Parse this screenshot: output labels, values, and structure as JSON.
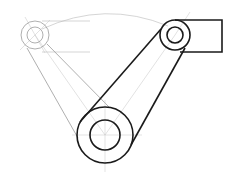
{
  "drawing": {
    "type": "mechanical linkage sketch",
    "colors": {
      "bold_line": "#1a1a1a",
      "ghost_line": "#9a9a9a",
      "construction_line": "#b8b8b8",
      "background": "#ffffff"
    },
    "pivot_left": {
      "cx": 35,
      "cy": 35,
      "r_outer": 14,
      "r_inner": 8,
      "style": "ghost"
    },
    "pivot_right": {
      "cx": 175,
      "cy": 35,
      "r_outer": 15,
      "r_inner": 8,
      "style": "bold"
    },
    "pivot_bottom": {
      "cx": 105,
      "cy": 135,
      "r_outer": 28,
      "r_inner": 15,
      "style": "bold"
    },
    "bracket": {
      "x1": 175,
      "y1": 20,
      "x2": 222,
      "y2": 52
    },
    "swing_arc_radius": 122
  }
}
